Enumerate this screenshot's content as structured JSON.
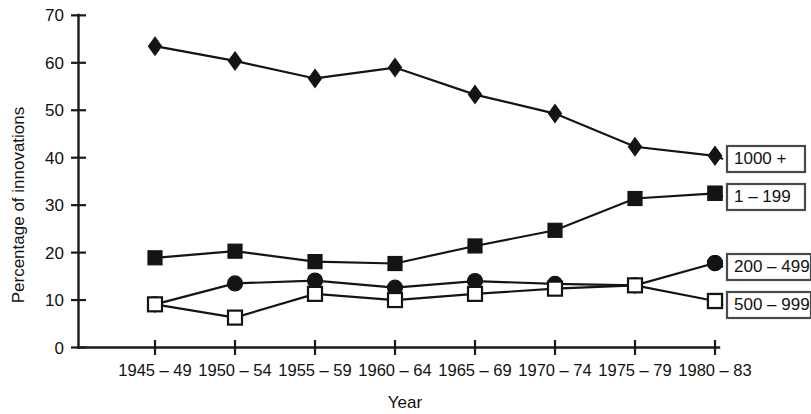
{
  "chart_data": {
    "type": "line",
    "title": "",
    "xlabel": "Year",
    "ylabel": "Percentage of innovations",
    "categories": [
      "1945 – 49",
      "1950 – 54",
      "1955 – 59",
      "1960 – 64",
      "1965 – 69",
      "1970 – 74",
      "1975 – 79",
      "1980 – 83"
    ],
    "ylim": [
      0,
      70
    ],
    "yticks": [
      0,
      10,
      20,
      30,
      40,
      50,
      60,
      70
    ],
    "ytick_labels": [
      "0",
      "10",
      "20",
      "30",
      "40",
      "50",
      "60",
      "70"
    ],
    "grid": false,
    "legend_position": "right-inline",
    "series": [
      {
        "name": "1000 +",
        "marker": "filled-diamond",
        "values": [
          63.5,
          60.4,
          56.7,
          59.0,
          53.3,
          49.3,
          42.3,
          40.4
        ]
      },
      {
        "name": "1 – 199",
        "marker": "filled-square",
        "values": [
          18.9,
          20.3,
          18.1,
          17.7,
          21.4,
          24.7,
          31.4,
          32.5
        ]
      },
      {
        "name": "200 – 499",
        "marker": "filled-circle",
        "values": [
          9.1,
          13.5,
          14.1,
          12.6,
          14.0,
          13.4,
          13.1,
          17.8
        ]
      },
      {
        "name": "500 – 999",
        "marker": "open-square",
        "values": [
          9.1,
          6.3,
          11.3,
          10.0,
          11.3,
          12.4,
          13.1,
          9.8
        ]
      }
    ],
    "legend_entries": [
      {
        "label": "1000 +",
        "marker": "filled-diamond"
      },
      {
        "label": "1 – 199",
        "marker": "filled-square"
      },
      {
        "label": "200 – 499",
        "marker": "filled-circle"
      },
      {
        "label": "500 – 999",
        "marker": "open-square"
      }
    ]
  }
}
